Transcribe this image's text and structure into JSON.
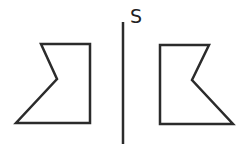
{
  "diagram": {
    "title": "",
    "mirror_line": {
      "label": "S",
      "x": 123,
      "y1": 22,
      "y2": 144,
      "color": "#2b2b2b"
    },
    "left_shape": {
      "description": "original figure",
      "points": "41,44 90,44 90,123 16,123 57,79",
      "stroke": "#2b2b2b",
      "fill": "#ffffff"
    },
    "right_shape": {
      "description": "mirror image reflected across line S",
      "points": "160,45 209,45 192,80 233,124 160,124",
      "stroke": "#2b2b2b",
      "fill": "#ffffff"
    }
  }
}
